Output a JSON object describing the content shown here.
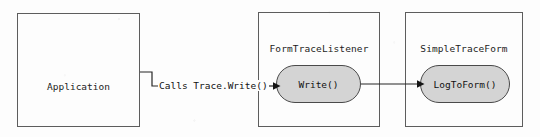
{
  "diagram": {
    "type": "flow-diagram",
    "title_visible": false,
    "background_color": "#fdfdfd",
    "stroke_color": "#262626",
    "pill_fill_color": "#d4d4d4",
    "boxes": [
      {
        "id": "application",
        "label": "Application"
      },
      {
        "id": "formtracelistener",
        "label": "FormTraceListener"
      },
      {
        "id": "simpletraceform",
        "label": "SimpleTraceForm"
      }
    ],
    "methods": [
      {
        "id": "write",
        "label": "Write()",
        "parent": "FormTraceListener"
      },
      {
        "id": "logtoform",
        "label": "LogToForm()",
        "parent": "SimpleTraceForm"
      }
    ],
    "edges": [
      {
        "id": "app-to-write",
        "label": "Calls Trace.Write()",
        "from": "Application",
        "to": "Write()",
        "arrowhead": "filled-triangle"
      },
      {
        "id": "write-to-logtoform",
        "label": "",
        "from": "Write()",
        "to": "LogToForm()",
        "arrowhead": "filled-triangle"
      }
    ]
  }
}
